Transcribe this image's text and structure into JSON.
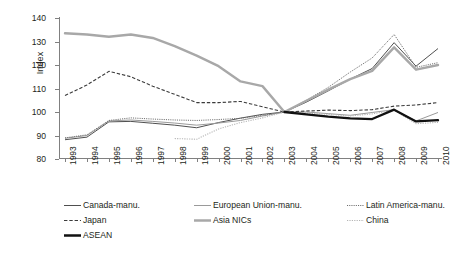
{
  "chart_data": {
    "type": "line",
    "title": "",
    "xlabel": "",
    "ylabel": "Index",
    "ylim": [
      80,
      140
    ],
    "yticks": [
      80,
      90,
      100,
      110,
      120,
      130,
      140
    ],
    "grid": false,
    "legend_position": "bottom",
    "categories": [
      "1993",
      "1994",
      "1995",
      "1996",
      "1997",
      "1998",
      "1999",
      "2000",
      "2001",
      "2002",
      "2003",
      "2004",
      "2005",
      "2006",
      "2007",
      "2008",
      "2009",
      "2010"
    ],
    "series": [
      {
        "name": "Canada-manu.",
        "style": "solid-thin-dark",
        "color": "#3b3b3b",
        "values": [
          88.2,
          89.3,
          95.8,
          96.0,
          95.2,
          94.4,
          93.3,
          95.5,
          97.4,
          99.0,
          100.0,
          104.2,
          109.0,
          114.0,
          118.5,
          129.5,
          119.5,
          127.0
        ]
      },
      {
        "name": "European Union-manu.",
        "style": "solid-thin-gray",
        "color": "#9a9a9a",
        "values": [
          88.8,
          90.0,
          96.2,
          96.6,
          96.0,
          95.3,
          94.4,
          95.3,
          96.4,
          98.3,
          100.0,
          100.0,
          99.3,
          98.6,
          99.8,
          101.0,
          96.2,
          99.8
        ]
      },
      {
        "name": "Latin America-manu.",
        "style": "dotted-fine",
        "color": "#6f6f6f",
        "values": [
          89.0,
          90.3,
          96.4,
          97.5,
          97.0,
          96.6,
          96.4,
          96.8,
          97.3,
          98.6,
          100.0,
          105.0,
          110.5,
          117.0,
          123.0,
          133.0,
          119.0,
          121.0
        ]
      },
      {
        "name": "Japan",
        "style": "dashed",
        "color": "#3b3b3b",
        "values": [
          107.0,
          111.5,
          117.3,
          115.0,
          111.0,
          107.5,
          104.0,
          104.0,
          104.5,
          102.2,
          100.0,
          100.4,
          100.8,
          100.6,
          101.0,
          102.5,
          103.0,
          104.0
        ]
      },
      {
        "name": "Asia NICs",
        "style": "solid-thick-gray",
        "color": "#a8a8a8",
        "values": [
          133.5,
          133.0,
          132.0,
          133.0,
          131.5,
          128.0,
          124.0,
          119.5,
          113.0,
          111.0,
          100.0,
          104.8,
          109.5,
          114.0,
          117.5,
          127.5,
          118.0,
          120.0
        ]
      },
      {
        "name": "China",
        "style": "dotted-light",
        "color": "#b5b5b5",
        "values": [
          null,
          null,
          null,
          null,
          null,
          88.7,
          88.4,
          92.8,
          95.5,
          97.5,
          100.0,
          99.6,
          99.0,
          98.3,
          99.2,
          100.8,
          95.0,
          95.6
        ]
      },
      {
        "name": "ASEAN",
        "style": "solid-thick-black",
        "color": "#111111",
        "values": [
          null,
          null,
          null,
          null,
          null,
          null,
          null,
          null,
          null,
          null,
          100.0,
          99.0,
          98.0,
          97.3,
          97.0,
          101.0,
          96.0,
          96.5
        ]
      }
    ]
  },
  "axes": {
    "y_label": "Index",
    "y_ticks": [
      "140",
      "130",
      "120",
      "110",
      "100",
      "90",
      "80"
    ],
    "x_ticks": [
      "1993",
      "1994",
      "1995",
      "1996",
      "1997",
      "1998",
      "1999",
      "2000",
      "2001",
      "2002",
      "2003",
      "2004",
      "2005",
      "2006",
      "2007",
      "2008",
      "2009",
      "2010"
    ]
  },
  "legend": {
    "entries": [
      {
        "label": "Canada-manu.",
        "swatch": "line-solid-thin-dark"
      },
      {
        "label": "European Union-manu.",
        "swatch": "line-solid-thin-gray"
      },
      {
        "label": "Latin America-manu.",
        "swatch": "line-dotted-fine"
      },
      {
        "label": "Japan",
        "swatch": "line-dashed"
      },
      {
        "label": "Asia NICs",
        "swatch": "line-solid-thick-gray"
      },
      {
        "label": "China",
        "swatch": "line-dotted-light"
      },
      {
        "label": "ASEAN",
        "swatch": "line-solid-thick-black"
      }
    ]
  }
}
